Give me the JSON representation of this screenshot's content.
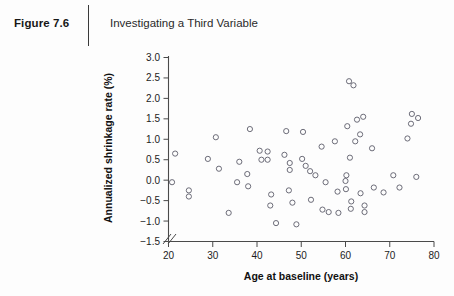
{
  "header": {
    "figure_label": "Figure 7.6",
    "title": "Investigating a Third Variable"
  },
  "colors": {
    "axis": "#4a4a4a",
    "point_stroke": "#5c5c6a",
    "text": "#1a1a1a",
    "background": "#fdfdfd"
  },
  "chart_data": {
    "type": "scatter",
    "title": "Investigating a Third Variable",
    "xlabel": "Age at baseline (years)",
    "ylabel": "Annualized shrinkage rate (%)",
    "xlim": [
      20,
      80
    ],
    "ylim": [
      -1.5,
      3.0
    ],
    "xticks": [
      20,
      30,
      40,
      50,
      60,
      70,
      80
    ],
    "yticks": [
      -1.5,
      -1.0,
      -0.5,
      0.0,
      0.5,
      1.0,
      1.5,
      2.0,
      2.5,
      3.0
    ],
    "xtick_labels": [
      "20",
      "30",
      "40",
      "50",
      "60",
      "70",
      "80"
    ],
    "ytick_labels": [
      "−1.5",
      "−1.0",
      "−0.5",
      "0.0",
      "0.5",
      "1.0",
      "1.5",
      "2.0",
      "2.5",
      "3.0"
    ],
    "grid": false,
    "legend": null,
    "axis_break": {
      "axis": "both",
      "near_origin": true,
      "symbol": "//"
    },
    "marker": {
      "shape": "circle",
      "filled": false,
      "radius_px": 2.6
    },
    "n_points": 62,
    "points": [
      [
        21.5,
        0.65
      ],
      [
        20.8,
        -0.05
      ],
      [
        24.6,
        -0.25
      ],
      [
        24.6,
        -0.4
      ],
      [
        30.7,
        1.05
      ],
      [
        28.9,
        0.52
      ],
      [
        31.4,
        0.28
      ],
      [
        33.6,
        -0.8
      ],
      [
        35.5,
        -0.05
      ],
      [
        36.0,
        0.45
      ],
      [
        38.4,
        1.25
      ],
      [
        37.8,
        0.15
      ],
      [
        38.0,
        -0.15
      ],
      [
        40.6,
        0.72
      ],
      [
        41.0,
        0.5
      ],
      [
        42.4,
        0.7
      ],
      [
        42.4,
        0.5
      ],
      [
        43.2,
        -0.35
      ],
      [
        43.0,
        -0.62
      ],
      [
        44.3,
        -1.05
      ],
      [
        46.6,
        1.2
      ],
      [
        46.2,
        0.62
      ],
      [
        47.4,
        0.42
      ],
      [
        47.4,
        0.25
      ],
      [
        47.2,
        -0.25
      ],
      [
        48.0,
        -0.55
      ],
      [
        48.9,
        -1.08
      ],
      [
        50.4,
        1.18
      ],
      [
        50.2,
        0.52
      ],
      [
        51.0,
        0.35
      ],
      [
        52.0,
        0.22
      ],
      [
        53.2,
        0.12
      ],
      [
        52.2,
        -0.48
      ],
      [
        54.6,
        0.82
      ],
      [
        55.5,
        -0.05
      ],
      [
        54.8,
        -0.72
      ],
      [
        56.2,
        -0.78
      ],
      [
        57.6,
        0.95
      ],
      [
        58.2,
        -0.28
      ],
      [
        58.4,
        -0.8
      ],
      [
        60.8,
        2.42
      ],
      [
        61.8,
        2.32
      ],
      [
        60.4,
        1.32
      ],
      [
        62.6,
        1.48
      ],
      [
        64.0,
        1.55
      ],
      [
        63.3,
        1.12
      ],
      [
        62.2,
        0.95
      ],
      [
        61.0,
        0.55
      ],
      [
        60.2,
        0.12
      ],
      [
        60.0,
        -0.02
      ],
      [
        60.1,
        -0.22
      ],
      [
        61.3,
        -0.52
      ],
      [
        61.2,
        -0.7
      ],
      [
        63.4,
        -0.32
      ],
      [
        64.3,
        -0.62
      ],
      [
        64.3,
        -0.78
      ],
      [
        66.0,
        0.78
      ],
      [
        66.4,
        -0.18
      ],
      [
        68.6,
        -0.3
      ],
      [
        70.8,
        0.12
      ],
      [
        72.2,
        -0.18
      ],
      [
        74.0,
        1.02
      ],
      [
        75.0,
        1.62
      ],
      [
        74.8,
        1.38
      ],
      [
        76.4,
        1.52
      ],
      [
        76.0,
        0.08
      ]
    ]
  }
}
